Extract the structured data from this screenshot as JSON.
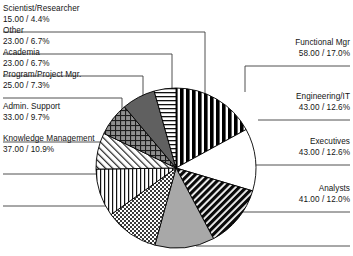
{
  "chart_data": {
    "type": "pie",
    "title": "",
    "subtitle": "",
    "xlabel": "",
    "ylabel": "",
    "legend_position": "callout-labels",
    "grid": false,
    "total": 341,
    "value_format": "value / percent",
    "categories": [
      "Functional Mgr",
      "Engineering/IT",
      "Executives",
      "Analysts",
      "Knowledge Management",
      "Admin. Support",
      "Program/Project Mgr.",
      "Academia",
      "Other",
      "Scientist/Researcher"
    ],
    "values": [
      58,
      43,
      43,
      41,
      37,
      33,
      25,
      23,
      23,
      15
    ],
    "percents": [
      17.0,
      12.6,
      12.6,
      12.0,
      10.9,
      9.7,
      7.3,
      6.7,
      6.7,
      4.4
    ],
    "slices": [
      {
        "label": "Functional Mgr",
        "value": "58.00",
        "percent": "17.0%",
        "value_label": "58.00 / 17.0%",
        "fill": "vertical-thick-black",
        "side": "right"
      },
      {
        "label": "Engineering/IT",
        "value": "43.00",
        "percent": "12.6%",
        "value_label": "43.00 / 12.6%",
        "fill": "solid-white",
        "side": "right"
      },
      {
        "label": "Executives",
        "value": "43.00",
        "percent": "12.6%",
        "value_label": "43.00 / 12.6%",
        "fill": "diagonal-black",
        "side": "right"
      },
      {
        "label": "Analysts",
        "value": "41.00",
        "percent": "12.0%",
        "value_label": "41.00 / 12.0%",
        "fill": "solid-gray",
        "side": "right"
      },
      {
        "label": "Knowledge Management",
        "value": "37.00",
        "percent": "10.9%",
        "value_label": "37.00 / 10.9%",
        "fill": "checkerboard",
        "side": "left"
      },
      {
        "label": "Admin. Support",
        "value": "33.00",
        "percent": "9.7%",
        "value_label": "33.00 / 9.7%",
        "fill": "vertical-thin",
        "side": "left"
      },
      {
        "label": "Program/Project Mgr.",
        "value": "25.00",
        "percent": "7.3%",
        "value_label": "25.00 / 7.3%",
        "fill": "diagonal-light",
        "side": "left"
      },
      {
        "label": "Academia",
        "value": "23.00",
        "percent": "6.7%",
        "value_label": "23.00 / 6.7%",
        "fill": "crosshatch-gray",
        "side": "left"
      },
      {
        "label": "Other",
        "value": "23.00",
        "percent": "6.7%",
        "value_label": "23.00 / 6.7%",
        "fill": "solid-dark-gray",
        "side": "left"
      },
      {
        "label": "Scientist/Researcher",
        "value": "15.00",
        "percent": "4.4%",
        "value_label": "15.00 / 4.4%",
        "fill": "horizontal-thin",
        "side": "left"
      }
    ],
    "colors": {
      "outline": "#000000",
      "text": "#141414",
      "leader_line": "#3c3c3c",
      "gray_slice": "#a8a8a8",
      "dark_gray_slice": "#606060",
      "background": "#ffffff"
    }
  }
}
